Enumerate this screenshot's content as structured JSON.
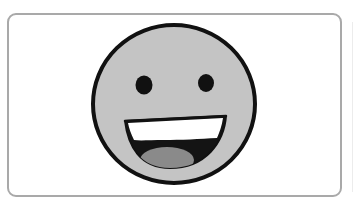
{
  "card": {
    "label": "Happy face",
    "border_color": "#a9a9a9",
    "background": "#ffffff"
  },
  "icon": {
    "name": "grinning-face-icon",
    "face_fill": "#c4c4c4",
    "outline_color": "#111111",
    "teeth_color": "#ffffff",
    "mouth_color": "#141414",
    "tongue_color": "#8a8a8a"
  }
}
